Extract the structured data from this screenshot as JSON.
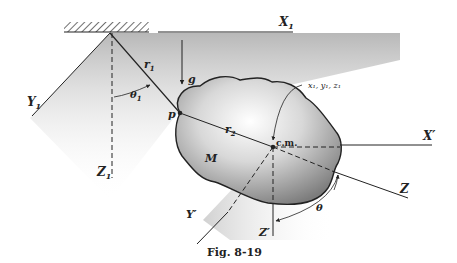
{
  "figure": {
    "caption": "Fig. 8-19"
  },
  "labels": {
    "x1_axis": "X",
    "x1_sub": "1",
    "y1_axis": "Y",
    "y1_sub": "1",
    "z1_axis": "Z",
    "z1_sub": "1",
    "r1": "r",
    "r1_sub": "1",
    "r2": "r",
    "r2_sub": "2",
    "theta1": "θ",
    "theta1_sub": "1",
    "theta": "θ",
    "gravity": "g",
    "point_p": "p",
    "mass": "M",
    "center_of_mass": "c.m.",
    "cm_coords": "x₁, y₁, z₁",
    "x_prime": "X′",
    "y_prime": "Y′",
    "z_prime": "Z′",
    "z_axis": "Z"
  },
  "colors": {
    "line": "#222222",
    "shade_dark": "#8a8a8a",
    "shade_light": "#f4f4f4",
    "background": "#ffffff"
  }
}
